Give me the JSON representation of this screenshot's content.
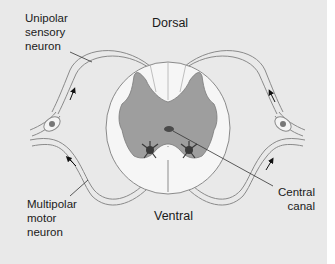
{
  "figure": {
    "labels": {
      "unipolar": "Unipolar\nsensory\nneuron",
      "dorsal": "Dorsal",
      "multipolar": "Multipolar\nmotor\nneuron",
      "ventral": "Ventral",
      "central_canal": "Central\ncanal"
    },
    "colors": {
      "background": "#e9e9e9",
      "white_matter": "#f6f6f6",
      "gray_matter": "#9e9e9e",
      "central_canal": "#4a4a4a",
      "neuron_body": "#3a3a3a",
      "outline": "#8a8a8a",
      "leader_line": "#333333"
    }
  }
}
